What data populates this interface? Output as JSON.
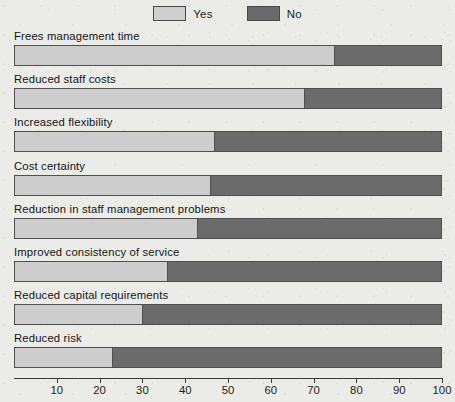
{
  "legend": {
    "items": [
      {
        "label": "Yes",
        "color": "#cdcdcd",
        "swatch": "yes-swatch"
      },
      {
        "label": "No",
        "color": "#6b6b6b",
        "swatch": "no-swatch"
      }
    ]
  },
  "axis": {
    "ticks": [
      10,
      20,
      30,
      40,
      50,
      60,
      70,
      80,
      90,
      100
    ],
    "min": 0,
    "max": 100
  },
  "chart_data": {
    "type": "bar",
    "orientation": "horizontal",
    "stacked": true,
    "title": "",
    "subtitle": "",
    "xlabel": "",
    "ylabel": "",
    "xlim": [
      0,
      100
    ],
    "grid": false,
    "legend_position": "top-center",
    "categories": [
      "Frees management time",
      "Reduced staff costs",
      "Increased flexibility",
      "Cost certainty",
      "Reduction in staff management problems",
      "Improved consistency of service",
      "Reduced capital requirements",
      "Reduced risk"
    ],
    "series": [
      {
        "name": "Yes",
        "color": "#cdcdcd",
        "values": [
          75,
          68,
          47,
          46,
          43,
          36,
          30,
          23
        ]
      },
      {
        "name": "No",
        "color": "#6b6b6b",
        "values": [
          25,
          32,
          53,
          54,
          57,
          64,
          70,
          77
        ]
      }
    ],
    "tick_labels": [
      "10",
      "20",
      "30",
      "40",
      "50",
      "60",
      "70",
      "80",
      "90",
      "100"
    ]
  }
}
